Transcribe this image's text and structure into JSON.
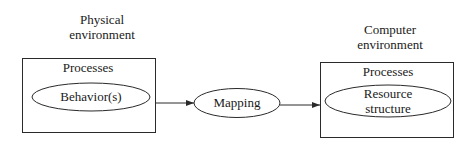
{
  "diagram": {
    "physical_env": {
      "line1": "Physical",
      "line2": "environment"
    },
    "computer_env": {
      "line1": "Computer",
      "line2": "environment"
    },
    "left_box": {
      "title": "Processes",
      "ellipse_label": "Behavior(s)"
    },
    "middle": {
      "ellipse_label": "Mapping"
    },
    "right_box": {
      "title": "Processes",
      "ellipse_line1": "Resource",
      "ellipse_line2": "structure"
    },
    "edges": [
      {
        "from": "Behavior(s)",
        "to": "Mapping"
      },
      {
        "from": "Mapping",
        "to": "Resource structure"
      }
    ],
    "colors": {
      "stroke": "#2a2a2a",
      "text": "#1a1a1a",
      "background": "#ffffff"
    }
  }
}
